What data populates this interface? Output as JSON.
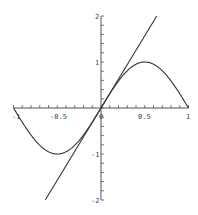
{
  "chart_data": {
    "type": "line",
    "title": "",
    "xlabel": "",
    "ylabel": "",
    "xlim": [
      -1,
      1
    ],
    "ylim": [
      -2,
      2
    ],
    "grid": false,
    "legend": null,
    "x_ticks": [
      "-1",
      "-0.5",
      "0",
      "0.5",
      "1"
    ],
    "y_ticks": [
      "-2",
      "-1",
      "1",
      "2"
    ],
    "series": [
      {
        "name": "sin(pi x)",
        "x": [
          -1,
          -0.75,
          -0.5,
          -0.25,
          0,
          0.25,
          0.5,
          0.75,
          1
        ],
        "values": [
          0,
          -0.707,
          -1,
          -0.707,
          0,
          0.707,
          1,
          0.707,
          0
        ]
      },
      {
        "name": "tangent y = pi x",
        "x": [
          -0.637,
          0.637
        ],
        "values": [
          -2,
          2
        ]
      }
    ],
    "colors": {
      "curve": "#333333",
      "axis": "#555555"
    }
  },
  "labels": {
    "xm1": "-1",
    "xm05": "-0.5",
    "x0": "0",
    "x05": "0.5",
    "x1": "1",
    "y2": "2",
    "y1": "1",
    "ym1": "-1",
    "ym2": "-2"
  }
}
